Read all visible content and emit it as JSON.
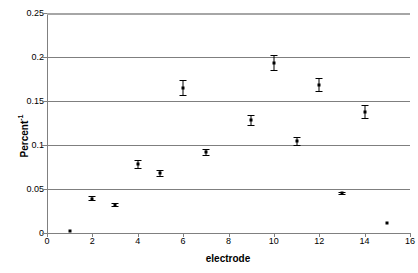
{
  "chart_data": {
    "type": "scatter",
    "title": "",
    "xlabel": "electrode",
    "ylabel": "Percent⁻¹",
    "ylabel_text": "Percent",
    "ylabel_superscript": "-1",
    "xlim": [
      0,
      16
    ],
    "ylim": [
      0,
      0.25
    ],
    "xticks": [
      0,
      2,
      4,
      6,
      8,
      10,
      12,
      14,
      16
    ],
    "xtick_labels": [
      "0",
      "2",
      "4",
      "6",
      "8",
      "10",
      "12",
      "14",
      "16"
    ],
    "yticks": [
      0,
      0.05,
      0.1,
      0.15,
      0.2,
      0.25
    ],
    "ytick_labels": [
      "0",
      "0.05",
      "0.1",
      "0.15",
      "0.2",
      "0.25"
    ],
    "grid": "horizontal",
    "legend": "none",
    "marker_color": "#000000",
    "gridline_color": "#7f7f7f",
    "x": [
      1,
      2,
      3,
      4,
      5,
      6,
      7,
      9,
      10,
      11,
      12,
      13,
      14,
      15
    ],
    "values": [
      0.002,
      0.039,
      0.032,
      0.078,
      0.068,
      0.165,
      0.092,
      0.128,
      0.193,
      0.104,
      0.168,
      0.045,
      0.137,
      0.011
    ],
    "errors": [
      0.0,
      0.003,
      0.002,
      0.005,
      0.004,
      0.009,
      0.004,
      0.006,
      0.009,
      0.005,
      0.008,
      0.002,
      0.008,
      0.0
    ],
    "points": [
      {
        "electrode": 1,
        "value": 0.002,
        "error": 0.0
      },
      {
        "electrode": 2,
        "value": 0.039,
        "error": 0.003
      },
      {
        "electrode": 3,
        "value": 0.032,
        "error": 0.002
      },
      {
        "electrode": 4,
        "value": 0.078,
        "error": 0.005
      },
      {
        "electrode": 5,
        "value": 0.068,
        "error": 0.004
      },
      {
        "electrode": 6,
        "value": 0.165,
        "error": 0.009
      },
      {
        "electrode": 7,
        "value": 0.092,
        "error": 0.004
      },
      {
        "electrode": 9,
        "value": 0.128,
        "error": 0.006
      },
      {
        "electrode": 10,
        "value": 0.193,
        "error": 0.009
      },
      {
        "electrode": 11,
        "value": 0.104,
        "error": 0.005
      },
      {
        "electrode": 12,
        "value": 0.168,
        "error": 0.008
      },
      {
        "electrode": 13,
        "value": 0.045,
        "error": 0.002
      },
      {
        "electrode": 14,
        "value": 0.137,
        "error": 0.008
      },
      {
        "electrode": 15,
        "value": 0.011,
        "error": 0.0
      }
    ]
  }
}
